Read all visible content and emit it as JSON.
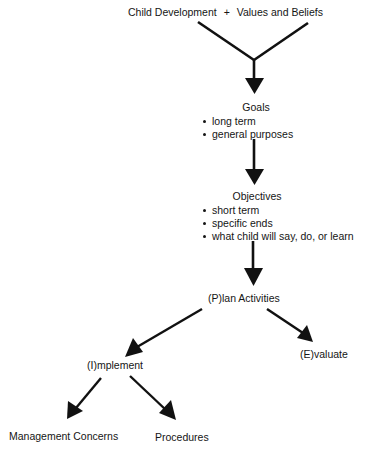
{
  "diagram": {
    "title": {
      "left": "Child Development",
      "plus": "+",
      "right": "Values and Beliefs"
    },
    "goals": {
      "label": "Goals",
      "bullets": [
        "long term",
        "general purposes"
      ]
    },
    "objectives": {
      "label": "Objectives",
      "bullets": [
        "short term",
        "specific ends",
        "what child will say, do, or learn"
      ]
    },
    "plan": {
      "label": "(P)lan Activities"
    },
    "implement": {
      "label": "(I)mplement"
    },
    "evaluate": {
      "label": "(E)valuate"
    },
    "management": {
      "label": "Management Concerns"
    },
    "procedures": {
      "label": "Procedures"
    },
    "colors": {
      "ink": "#111111",
      "background": "#ffffff"
    },
    "edges": [
      {
        "from": "Child Development",
        "to": "Goals"
      },
      {
        "from": "Values and Beliefs",
        "to": "Goals"
      },
      {
        "from": "Goals",
        "to": "Objectives"
      },
      {
        "from": "Objectives",
        "to": "(P)lan Activities"
      },
      {
        "from": "(P)lan Activities",
        "to": "(I)mplement"
      },
      {
        "from": "(P)lan Activities",
        "to": "(E)valuate"
      },
      {
        "from": "(I)mplement",
        "to": "Management Concerns"
      },
      {
        "from": "(I)mplement",
        "to": "Procedures"
      }
    ]
  }
}
